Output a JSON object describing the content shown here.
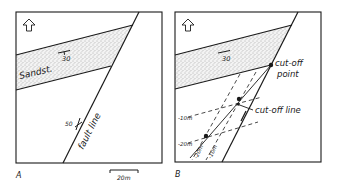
{
  "panels": [
    {
      "id": "A",
      "panel_label": "A",
      "unit_label": "Sandst.",
      "bedding_dip": "30",
      "fault_dip": "50",
      "fault_label": "fault line",
      "scale_label": "20m",
      "north_icon": "north-arrow-icon"
    },
    {
      "id": "B",
      "panel_label": "B",
      "bedding_dip": "30",
      "cutoff_point_label_1": "cut-off",
      "cutoff_point_label_2": "point",
      "cutoff_line_label": "cut-off line",
      "bed_contours": [
        "-10m",
        "-20m"
      ],
      "fault_contours": [
        "-20m",
        "-10m"
      ],
      "north_icon": "north-arrow-icon"
    }
  ],
  "colors": {
    "line": "#1a1a1a",
    "stipple": "#6b6b6b",
    "background": "#ffffff"
  }
}
